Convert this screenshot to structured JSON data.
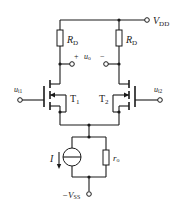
{
  "diagram": {
    "type": "MOSFET differential amplifier",
    "supply_positive": {
      "label": "V",
      "subscript": "DD"
    },
    "supply_negative": {
      "label": "−V",
      "subscript": "SS"
    },
    "drain_resistors": [
      {
        "label": "R",
        "subscript": "D"
      },
      {
        "label": "R",
        "subscript": "D"
      }
    ],
    "output": {
      "label": "u",
      "subscript": "o",
      "plus": "+",
      "minus": "−"
    },
    "transistors": [
      {
        "label": "T",
        "subscript": "1"
      },
      {
        "label": "T",
        "subscript": "2"
      }
    ],
    "inputs": [
      {
        "label": "u",
        "subscript": "i1"
      },
      {
        "label": "u",
        "subscript": "i2"
      }
    ],
    "current_source": {
      "label": "I"
    },
    "output_resistance": {
      "label": "r",
      "subscript": "o"
    }
  },
  "colors": {
    "line": "#1a1a1a",
    "background": "#ffffff"
  }
}
